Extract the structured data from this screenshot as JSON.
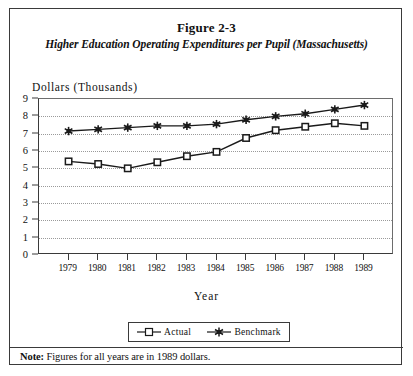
{
  "figure": {
    "title": "Figure 2-3",
    "subtitle": "Higher Education Operating Expenditures per Pupil (Massachusetts)",
    "note_label": "Note:",
    "note_body": " Figures for all years are in 1989 dollars."
  },
  "chart_data": {
    "type": "line",
    "title": "Higher Education Operating Expenditures per Pupil (Massachusetts)",
    "xlabel": "Year",
    "ylabel": "Dollars (Thousands)",
    "categories": [
      "1979",
      "1980",
      "1981",
      "1982",
      "1983",
      "1984",
      "1985",
      "1986",
      "1987",
      "1988",
      "1989"
    ],
    "x": [
      1979,
      1980,
      1981,
      1982,
      1983,
      1984,
      1985,
      1986,
      1987,
      1988,
      1989
    ],
    "ylim": [
      0,
      9
    ],
    "yticks": [
      0,
      1,
      2,
      3,
      4,
      5,
      6,
      7,
      8,
      9
    ],
    "ytick_labels": [
      "0",
      "1",
      "2",
      "3",
      "4",
      "5",
      "6",
      "7",
      "8",
      "9"
    ],
    "grid": "horizontal-dotted",
    "legend_position": "bottom-center",
    "series": [
      {
        "name": "Actual",
        "marker": "open-square",
        "color": "#1a1a1a",
        "values": [
          5.4,
          5.25,
          5.0,
          5.35,
          5.7,
          5.95,
          6.75,
          7.2,
          7.4,
          7.6,
          7.45
        ]
      },
      {
        "name": "Benchmark",
        "marker": "filled-star",
        "color": "#1a1a1a",
        "values": [
          7.15,
          7.25,
          7.35,
          7.45,
          7.45,
          7.55,
          7.8,
          8.0,
          8.15,
          8.4,
          8.65
        ]
      }
    ]
  },
  "legend": {
    "entries": [
      {
        "label": "Actual",
        "marker": "open-square-icon"
      },
      {
        "label": "Benchmark",
        "marker": "filled-star-icon"
      }
    ]
  }
}
